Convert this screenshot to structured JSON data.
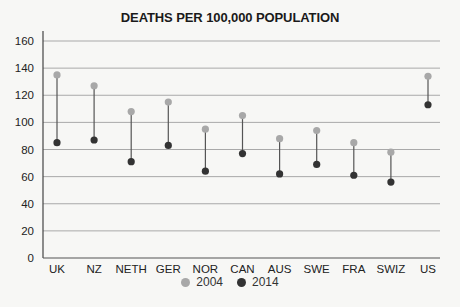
{
  "chart_data": {
    "type": "dumbbell",
    "title": "DEATHS PER 100,000 POPULATION",
    "xlabel": "",
    "ylabel": "",
    "ylim": [
      0,
      160
    ],
    "yticks": [
      0,
      20,
      40,
      60,
      80,
      100,
      120,
      140,
      160
    ],
    "grid": true,
    "legend_position": "bottom",
    "categories": [
      "UK",
      "NZ",
      "NETH",
      "GER",
      "NOR",
      "CAN",
      "AUS",
      "SWE",
      "FRA",
      "SWIZ",
      "US"
    ],
    "series": [
      {
        "name": "2004",
        "color": "#a8a8a8",
        "values": [
          135,
          127,
          108,
          115,
          95,
          105,
          88,
          94,
          85,
          78,
          134
        ]
      },
      {
        "name": "2014",
        "color": "#333333",
        "values": [
          85,
          87,
          71,
          83,
          64,
          77,
          62,
          69,
          61,
          56,
          113
        ]
      }
    ]
  },
  "legend": [
    {
      "label": "2004",
      "color": "#a8a8a8"
    },
    {
      "label": "2014",
      "color": "#333333"
    }
  ]
}
